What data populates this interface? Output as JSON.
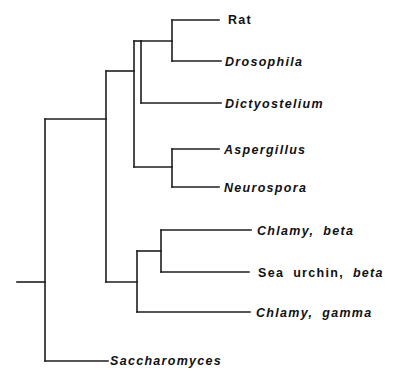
{
  "diagram": {
    "type": "phylogenetic-tree",
    "line_color": "#1e1e1e",
    "text_color": "#111111",
    "taxa": [
      {
        "id": "rat",
        "parts": [
          {
            "text": "Rat",
            "italic": false
          }
        ],
        "x": 228,
        "y": 20
      },
      {
        "id": "drosophila",
        "parts": [
          {
            "text": "Drosophila",
            "italic": true
          }
        ],
        "x": 225,
        "y": 62
      },
      {
        "id": "dictyostelium",
        "parts": [
          {
            "text": "Dictyostelium",
            "italic": true
          }
        ],
        "x": 225,
        "y": 104
      },
      {
        "id": "aspergillus",
        "parts": [
          {
            "text": "Aspergillus",
            "italic": true
          }
        ],
        "x": 224,
        "y": 150
      },
      {
        "id": "neurospora",
        "parts": [
          {
            "text": "Neurospora",
            "italic": true
          }
        ],
        "x": 224,
        "y": 188
      },
      {
        "id": "chlamy-beta",
        "parts": [
          {
            "text": "Chlamy,",
            "italic": true
          },
          {
            "text": "beta",
            "italic": true
          }
        ],
        "x": 257,
        "y": 231
      },
      {
        "id": "sea-urchin-beta",
        "parts": [
          {
            "text": "Sea",
            "italic": false
          },
          {
            "text": "urchin,",
            "italic": false
          },
          {
            "text": "beta",
            "italic": true
          }
        ],
        "x": 258,
        "y": 273
      },
      {
        "id": "chlamy-gamma",
        "parts": [
          {
            "text": "Chlamy,",
            "italic": true
          },
          {
            "text": "gamma",
            "italic": true
          }
        ],
        "x": 256,
        "y": 313
      },
      {
        "id": "saccharomyces",
        "parts": [
          {
            "text": "Saccharomyces",
            "italic": true
          }
        ],
        "x": 110,
        "y": 361
      }
    ],
    "labels": {
      "rat": "Rat",
      "drosophila": "Drosophila",
      "dictyostelium": "Dictyostelium",
      "aspergillus": "Aspergillus",
      "neurospora": "Neurospora",
      "chlamy_beta_1": "Chlamy,",
      "chlamy_beta_2": "beta",
      "sea_urchin_1": "Sea",
      "sea_urchin_2": "urchin,",
      "sea_urchin_3": "beta",
      "chlamy_gamma_1": "Chlamy,",
      "chlamy_gamma_2": "gamma",
      "saccharomyces": "Saccharomyces"
    },
    "newick": "((((Rat,Drosophila),Dictyostelium),(Aspergillus,Neurospora)),((Chlamy_beta,Sea_urchin_beta),Chlamy_gamma)),Saccharomyces);"
  }
}
